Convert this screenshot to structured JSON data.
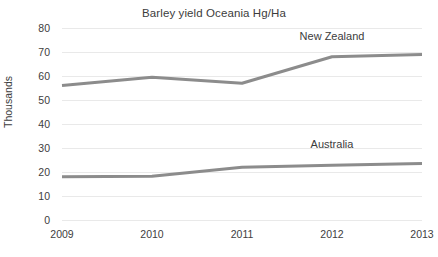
{
  "chart_data": {
    "type": "line",
    "title": "Barley yield Oceania Hg/Ha",
    "xlabel": "",
    "ylabel": "Thousands",
    "categories": [
      "2009",
      "2010",
      "2011",
      "2012",
      "2013"
    ],
    "x": [
      2009,
      2010,
      2011,
      2012,
      2013
    ],
    "ylim": [
      0,
      80
    ],
    "yticks": [
      "0",
      "10",
      "20",
      "30",
      "40",
      "50",
      "60",
      "70",
      "80"
    ],
    "ytick_values": [
      0,
      10,
      20,
      30,
      40,
      50,
      60,
      70,
      80
    ],
    "grid": true,
    "legend": "inline-labels",
    "series": [
      {
        "name": "New Zealand",
        "values": [
          56,
          59.5,
          57,
          68,
          69
        ],
        "color": "#8c8c8c",
        "label_x_value": 2012,
        "label_y_value": 74
      },
      {
        "name": "Australia",
        "values": [
          18,
          18.2,
          22,
          22.8,
          23.5
        ],
        "color": "#8c8c8c",
        "label_x_value": 2012,
        "label_y_value": 29
      }
    ],
    "colors": {
      "background": "#ffffff",
      "gridline": "#e9e9e9",
      "text": "#3c3c3c",
      "line": "#8c8c8c"
    }
  }
}
